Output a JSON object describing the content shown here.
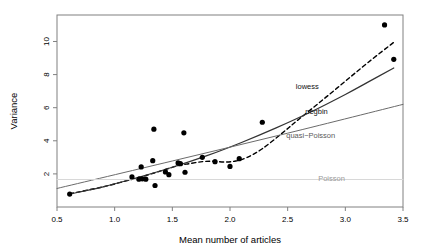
{
  "chart_data": {
    "type": "scatter",
    "title": "",
    "xlabel": "Mean number of articles",
    "ylabel": "Variance",
    "xlim": [
      0.5,
      3.5
    ],
    "ylim": [
      0.0,
      11.6
    ],
    "grid": false,
    "legend_position": "inline-curve-labels",
    "xticks": [
      "0.5",
      "1.0",
      "1.5",
      "2.0",
      "2.5",
      "3.0",
      "3.5"
    ],
    "xtick_values": [
      0.5,
      1.0,
      1.5,
      2.0,
      2.5,
      3.0,
      3.5
    ],
    "yticks": [
      "2",
      "4",
      "6",
      "8",
      "10"
    ],
    "ytick_values": [
      2,
      4,
      6,
      8,
      10
    ],
    "points": [
      {
        "x": 0.61,
        "y": 0.78
      },
      {
        "x": 1.15,
        "y": 1.82
      },
      {
        "x": 1.21,
        "y": 1.68
      },
      {
        "x": 1.23,
        "y": 2.42
      },
      {
        "x": 1.24,
        "y": 1.7
      },
      {
        "x": 1.27,
        "y": 1.68
      },
      {
        "x": 1.33,
        "y": 2.8
      },
      {
        "x": 1.34,
        "y": 4.7
      },
      {
        "x": 1.35,
        "y": 1.3
      },
      {
        "x": 1.44,
        "y": 2.12
      },
      {
        "x": 1.47,
        "y": 1.95
      },
      {
        "x": 1.55,
        "y": 2.66
      },
      {
        "x": 1.57,
        "y": 2.62
      },
      {
        "x": 1.6,
        "y": 4.48
      },
      {
        "x": 1.61,
        "y": 2.1
      },
      {
        "x": 1.76,
        "y": 3.0
      },
      {
        "x": 1.87,
        "y": 2.74
      },
      {
        "x": 2.0,
        "y": 2.45
      },
      {
        "x": 2.08,
        "y": 2.92
      },
      {
        "x": 2.28,
        "y": 5.12
      },
      {
        "x": 3.34,
        "y": 11.0
      },
      {
        "x": 3.42,
        "y": 8.92
      }
    ],
    "curves": [
      {
        "name": "lowess",
        "label": "lowess",
        "style": "dashed",
        "color": "#000000",
        "width": 1.4,
        "label_x": 2.67,
        "label_y": 7.25,
        "points": [
          {
            "x": 0.61,
            "y": 0.8
          },
          {
            "x": 0.9,
            "y": 1.22
          },
          {
            "x": 1.1,
            "y": 1.58
          },
          {
            "x": 1.25,
            "y": 1.86
          },
          {
            "x": 1.4,
            "y": 2.18
          },
          {
            "x": 1.55,
            "y": 2.5
          },
          {
            "x": 1.65,
            "y": 2.62
          },
          {
            "x": 1.76,
            "y": 2.74
          },
          {
            "x": 1.85,
            "y": 2.76
          },
          {
            "x": 1.95,
            "y": 2.72
          },
          {
            "x": 2.05,
            "y": 2.78
          },
          {
            "x": 2.15,
            "y": 3.0
          },
          {
            "x": 2.28,
            "y": 3.52
          },
          {
            "x": 2.45,
            "y": 4.45
          },
          {
            "x": 2.6,
            "y": 5.32
          },
          {
            "x": 2.8,
            "y": 6.45
          },
          {
            "x": 3.0,
            "y": 7.6
          },
          {
            "x": 3.2,
            "y": 8.75
          },
          {
            "x": 3.42,
            "y": 9.95
          }
        ]
      },
      {
        "name": "negbin",
        "label": "negbin",
        "style": "solid",
        "color": "#333333",
        "width": 1.2,
        "label_x": 2.75,
        "label_y": 5.72,
        "points": [
          {
            "x": 0.61,
            "y": 0.78
          },
          {
            "x": 0.9,
            "y": 1.22
          },
          {
            "x": 1.2,
            "y": 1.78
          },
          {
            "x": 1.5,
            "y": 2.4
          },
          {
            "x": 1.8,
            "y": 3.1
          },
          {
            "x": 2.1,
            "y": 3.9
          },
          {
            "x": 2.4,
            "y": 4.78
          },
          {
            "x": 2.7,
            "y": 5.74
          },
          {
            "x": 3.0,
            "y": 6.8
          },
          {
            "x": 3.2,
            "y": 7.56
          },
          {
            "x": 3.42,
            "y": 8.4
          }
        ]
      },
      {
        "name": "quasi-poisson",
        "label": "quasi−Poisson",
        "style": "solid",
        "color": "#6b6b6b",
        "width": 1.0,
        "label_x": 2.7,
        "label_y": 4.28,
        "points": [
          {
            "x": 0.5,
            "y": 1.12
          },
          {
            "x": 1.5,
            "y": 2.78
          },
          {
            "x": 2.5,
            "y": 4.46
          },
          {
            "x": 3.5,
            "y": 6.2
          }
        ]
      },
      {
        "name": "poisson",
        "label": "Poisson",
        "style": "solid",
        "color": "#d8d8d8",
        "width": 1.0,
        "label_x": 2.88,
        "label_y": 1.72,
        "points": [
          {
            "x": 0.5,
            "y": 1.66
          },
          {
            "x": 3.5,
            "y": 1.66
          }
        ]
      }
    ],
    "point_color": "#000000",
    "point_radius": 2.6,
    "axis_color": "#808080",
    "box_color": "#808080"
  }
}
